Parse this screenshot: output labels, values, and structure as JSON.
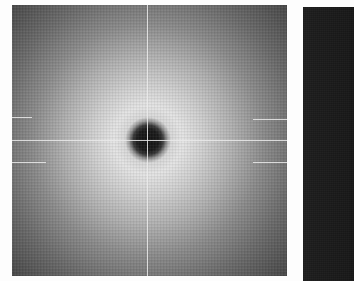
{
  "image": {
    "description": "Grayscale diffraction-pattern style image with a dark central beam-stop spot surrounded by a bright halo fading to dark edges, crossed by thin light grid lines; a second dark panel is partially visible at right",
    "panels": [
      {
        "id": "left",
        "content": "radial intensity pattern with dark center spot",
        "center_spot": "dark circle",
        "crosshair_lines": {
          "vertical": "single thin light line through center",
          "horizontal": "thin light line segments through center region"
        }
      },
      {
        "id": "right",
        "content": "dark uniform panel (partially cropped)"
      }
    ],
    "colors": {
      "background": "#fdfdfd",
      "center_spot": "#141414",
      "halo": "#e4e4e4",
      "edge": "#3a3a3a",
      "right_panel": "#1c1c1c",
      "grid_line": "#ebebeb"
    }
  }
}
